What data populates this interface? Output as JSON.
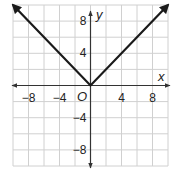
{
  "chart_data": {
    "type": "line",
    "title": "",
    "xlabel": "x",
    "ylabel": "y",
    "origin_label": "O",
    "xlim": [
      -10,
      10
    ],
    "ylim": [
      -10,
      10
    ],
    "grid": true,
    "grid_step": 2,
    "x_ticks": [
      {
        "value": -8,
        "label": "−8"
      },
      {
        "value": -4,
        "label": "−4"
      },
      {
        "value": 4,
        "label": "4"
      },
      {
        "value": 8,
        "label": "8"
      }
    ],
    "y_ticks": [
      {
        "value": 8,
        "label": "8"
      },
      {
        "value": 4,
        "label": "4"
      },
      {
        "value": -4,
        "label": "−4"
      },
      {
        "value": -8,
        "label": "−8"
      }
    ],
    "series": [
      {
        "name": "y = |x|",
        "x": [
          -10,
          0,
          10
        ],
        "y": [
          10,
          0,
          10
        ],
        "arrows": true,
        "color": "#1a1a1a"
      }
    ],
    "colors": {
      "grid": "#d0d0d0",
      "axis": "#333333",
      "line": "#1a1a1a"
    }
  }
}
